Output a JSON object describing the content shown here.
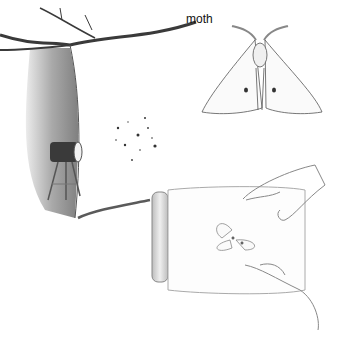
{
  "illustration": {
    "caption_label": "moth",
    "scenes": [
      {
        "name": "tree-with-light-trap",
        "description": "Tree branch with a lamp on a tripod casting a light sheet"
      },
      {
        "name": "moth-specimen",
        "description": "Pencil drawing of a moth with spotted wings"
      },
      {
        "name": "hands-with-jar",
        "description": "Hands holding a glass jar containing a moth"
      }
    ],
    "colors": {
      "background": "#ffffff",
      "pencil_dark": "#3a3a3a",
      "pencil_mid": "#8a8a8a",
      "pencil_light": "#c8c8c8"
    }
  }
}
